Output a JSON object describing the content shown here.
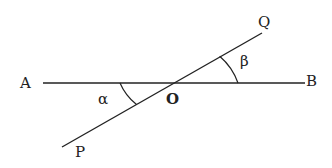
{
  "diagram": {
    "type": "intersecting-lines",
    "points": {
      "A": "A",
      "B": "B",
      "P": "P",
      "Q": "Q",
      "O": "O"
    },
    "angles": {
      "alpha": "α",
      "beta": "β"
    },
    "colors": {
      "stroke": "#222222",
      "background": "#ffffff"
    }
  }
}
